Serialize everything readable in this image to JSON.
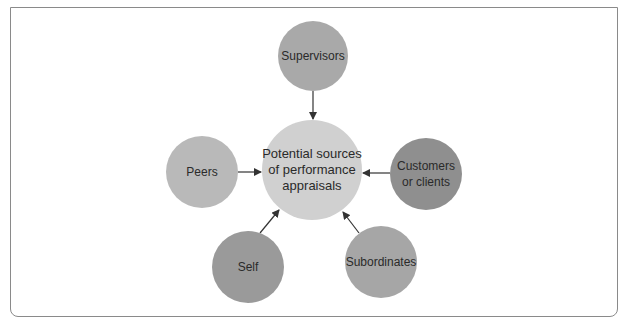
{
  "diagram": {
    "center": {
      "label_lines": [
        "Potential sources",
        "of performance",
        "appraisals"
      ],
      "color": "#d0d0d0"
    },
    "nodes": [
      {
        "id": "supervisors",
        "label_lines": [
          "Supervisors"
        ],
        "color": "#a9a9a9"
      },
      {
        "id": "peers",
        "label_lines": [
          "Peers"
        ],
        "color": "#b9b9b9"
      },
      {
        "id": "customers",
        "label_lines": [
          "Customers",
          "or clients"
        ],
        "color": "#8f8f8f"
      },
      {
        "id": "self",
        "label_lines": [
          "Self"
        ],
        "color": "#9a9a9a"
      },
      {
        "id": "subordinates",
        "label_lines": [
          "Subordinates"
        ],
        "color": "#a6a6a6"
      }
    ],
    "arrow_color": "#333333",
    "frame_color": "#8a8a8a"
  }
}
